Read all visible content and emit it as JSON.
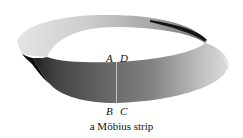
{
  "figure": {
    "subject": "Möbius strip",
    "caption": "a Möbius strip",
    "labels": {
      "top_left": "A",
      "top_right": "D",
      "bottom_left": "B",
      "bottom_right": "C"
    },
    "colors": {
      "background": "#ffffff",
      "band_dark": "#3a3a3a",
      "band_mid": "#8a8a8a",
      "band_light": "#e6e6e6",
      "seam": "#d8d8d8",
      "text": "#111111"
    }
  }
}
